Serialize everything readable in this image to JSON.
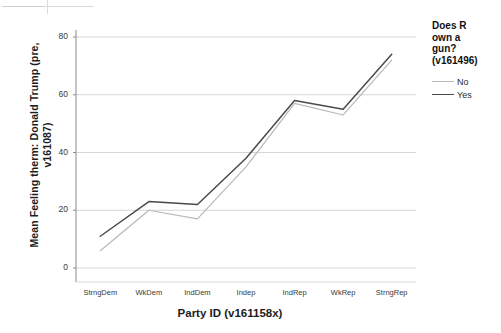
{
  "chart_data": {
    "type": "line",
    "title": "",
    "xlabel": "Party  ID (v161158x)",
    "ylabel": "Mean Feeling therm: Donald Trump (pre, v161087)",
    "categories": [
      "StrngDem",
      "WkDem",
      "IndDem",
      "Indep",
      "IndRep",
      "WkRep",
      "StrngRep"
    ],
    "ylim": [
      0,
      80
    ],
    "yticks": [
      0,
      20,
      40,
      60,
      80
    ],
    "ytick_labels": [
      "0",
      "20",
      "40",
      "60",
      "80"
    ],
    "grid": "horizontal",
    "legend_position": "right",
    "series": [
      {
        "name": "No",
        "color": "#b9b9b9",
        "values": [
          6,
          20,
          17,
          35,
          57,
          53,
          72
        ]
      },
      {
        "name": "Yes",
        "color": "#4a4a4a",
        "values": [
          11,
          23,
          22,
          38,
          58,
          55,
          74
        ]
      }
    ]
  },
  "legend": {
    "title_lines": [
      "Does R",
      "own a",
      "gun?",
      "(v161496)"
    ],
    "title": "Does R own a gun? (v161496)",
    "entries": [
      {
        "label": "No",
        "color": "#b9b9b9"
      },
      {
        "label": "Yes",
        "color": "#4a4a4a"
      }
    ]
  },
  "axes": {
    "y_title": "Mean Feeling therm: Donald Trump (pre, v161087)",
    "x_title": "Party  ID (v161158x)"
  },
  "colors": {
    "gridline": "#d6d6d6",
    "axis": "#8a8a8a",
    "series_no": "#b9b9b9",
    "series_yes": "#4a4a4a",
    "text": "#2b2b2b"
  }
}
